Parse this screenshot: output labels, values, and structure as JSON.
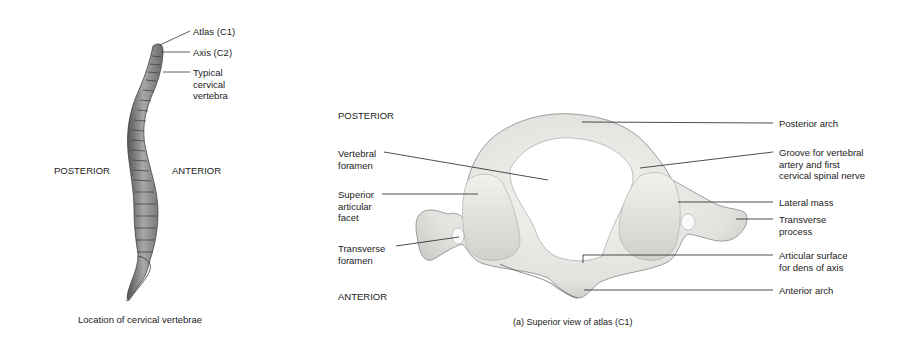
{
  "figure_left": {
    "labels": {
      "atlas": "Atlas (C1)",
      "axis": "Axis (C2)",
      "typical": [
        "Typical",
        "cervical",
        "vertebra"
      ],
      "posterior": "POSTERIOR",
      "anterior": "ANTERIOR"
    },
    "caption": "Location of cervical vertebrae"
  },
  "figure_right": {
    "orientation": {
      "posterior": "POSTERIOR",
      "anterior": "ANTERIOR"
    },
    "labels_left": {
      "vertebral_foramen": [
        "Vertebral",
        "foramen"
      ],
      "superior_articular_facet": [
        "Superior",
        "articular",
        "facet"
      ],
      "transverse_foramen": [
        "Transverse",
        "foramen"
      ]
    },
    "labels_right": {
      "posterior_arch": "Posterior arch",
      "groove": [
        "Groove for vertebral",
        "artery and first",
        "cervical spinal nerve"
      ],
      "lateral_mass": "Lateral mass",
      "transverse_process": [
        "Transverse",
        "process"
      ],
      "articular_surface": [
        "Articular surface",
        "for dens of axis"
      ],
      "anterior_arch": "Anterior arch"
    },
    "caption": "(a) Superior view of atlas (C1)"
  }
}
